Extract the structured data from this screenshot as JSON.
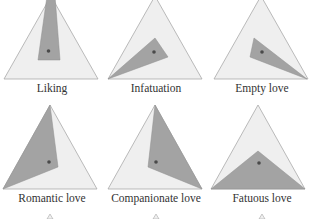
{
  "colors": {
    "background": "#ffffff",
    "triangle_fill": "#efefef",
    "triangle_stroke": "#a9a9a9",
    "region_fill": "#a3a3a3",
    "region_stroke": "#8e8e8e",
    "dot": "#4a4a4a",
    "label": "#333333"
  },
  "panels": [
    {
      "label": "Liking",
      "outer": "4,-4 98,79 4,79",
      "outer_tri": "51,-4 98,79 4,79",
      "region": "47,-4 55,-4 60,60 38,60",
      "dot": [
        48.5,
        51
      ]
    },
    {
      "label": "Infatuation",
      "outer_tri": "55,-4 102,79 8,79",
      "region": "8,79 55,38 68,57",
      "dot": [
        54,
        52
      ]
    },
    {
      "label": "Empty love",
      "outer_tri": "57,-4 104,79 10,79",
      "region": "103,79 50,38 46,57",
      "dot": [
        58,
        52
      ]
    },
    {
      "label": "Romantic love",
      "outer_tri": "50,0 97,84 3,84",
      "region": "3,84 50,0 58,62",
      "dot": [
        49,
        57
      ]
    },
    {
      "label": "Companionate love",
      "outer_tri": "55,0 102,84 8,84",
      "region": "55,0 102,84 48,62",
      "dot": [
        56,
        57
      ]
    },
    {
      "label": "Fatuous love",
      "outer_tri": "54,0 101,84 7,84",
      "region": "7,84 54,46 101,84",
      "dot": [
        55,
        58
      ]
    }
  ],
  "bottom_tips": [
    {
      "x": 50
    },
    {
      "x": 156
    },
    {
      "x": 262
    }
  ]
}
